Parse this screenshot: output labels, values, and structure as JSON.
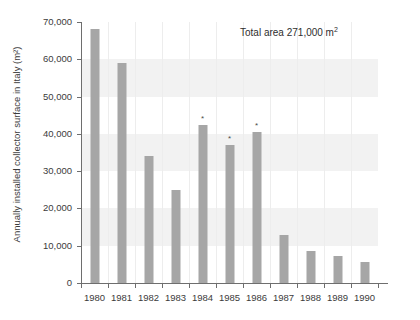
{
  "chart_data": {
    "type": "bar",
    "title": "",
    "xlabel": "",
    "ylabel": "Annually installed collector surface in Italy (m²)",
    "categories": [
      "1980",
      "1981",
      "1982",
      "1983",
      "1984",
      "1985",
      "1986",
      "1987",
      "1988",
      "1989",
      "1990"
    ],
    "values": [
      68000,
      59000,
      34000,
      25000,
      42500,
      37000,
      40500,
      13000,
      8500,
      7200,
      5500
    ],
    "markers": {
      "1984": "*",
      "1985": "*",
      "1986": "*"
    },
    "ylim": [
      0,
      70000
    ],
    "yticks": [
      0,
      10000,
      20000,
      30000,
      40000,
      50000,
      60000,
      70000
    ],
    "ytick_labels": [
      "0",
      "10,000",
      "20,000",
      "30,000",
      "40,000",
      "50,000",
      "60,000",
      "70,000"
    ],
    "grid": "vertical-faint-with-horizontal-bands",
    "legend": "none",
    "bar_color": "#a6a6a6",
    "annotations": [
      {
        "text": "Total area 271,000 m²",
        "position": "top-right"
      }
    ]
  },
  "annotation": {
    "total_area_prefix": "Total area 271,000 m",
    "total_area_exponent": "2"
  },
  "axis": {
    "y_title": "Annually installed collector surface in Italy (m²)"
  }
}
